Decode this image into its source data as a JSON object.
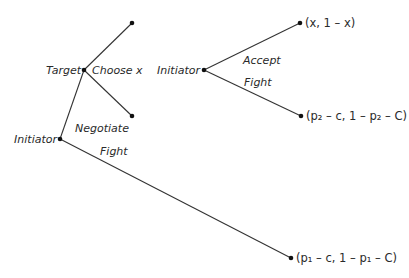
{
  "diagram": {
    "type": "game-tree",
    "left_tree": {
      "root": {
        "label": "Initiator",
        "x": 60,
        "y": 139
      },
      "target_node": {
        "label": "Target",
        "x": 84,
        "y": 70
      },
      "target_action_label": "Choose x",
      "negotiate_label": "Negotiate",
      "fight_label": "Fight",
      "target_leaves": [
        {
          "x": 132,
          "y": 23
        },
        {
          "x": 132,
          "y": 116
        }
      ],
      "fight_leaf": {
        "x": 291,
        "y": 258,
        "payoff": "(p₁ – c, 1 – p₁ – C)"
      }
    },
    "right_tree": {
      "root": {
        "label": "Initiator",
        "x": 204,
        "y": 70
      },
      "accept_label": "Accept",
      "fight_label": "Fight",
      "accept_leaf": {
        "x": 300,
        "y": 23,
        "payoff": "(x, 1 – x)"
      },
      "fight_leaf": {
        "x": 301,
        "y": 116,
        "payoff": "(p₂ – c, 1 – p₂ – C)"
      }
    }
  }
}
